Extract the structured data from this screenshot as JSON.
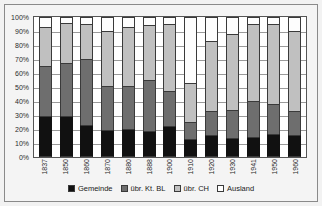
{
  "chart_data": {
    "type": "bar",
    "subtype": "stacked-100-percent",
    "title": "",
    "xlabel": "",
    "ylabel": "",
    "ylim": [
      0,
      100
    ],
    "ytick_labels": [
      "100%",
      "90%",
      "80%",
      "70%",
      "60%",
      "50%",
      "40%",
      "30%",
      "20%",
      "10%",
      "0%"
    ],
    "ytick_values": [
      100,
      90,
      80,
      70,
      60,
      50,
      40,
      30,
      20,
      10,
      0
    ],
    "grid": true,
    "legend_position": "bottom-center",
    "categories": [
      "1837",
      "1850",
      "1860",
      "1870",
      "1880",
      "1888",
      "1900",
      "1910",
      "1920",
      "1930",
      "1941",
      "1950",
      "1960"
    ],
    "series": [
      {
        "name": "Gemeinde",
        "color": "#111111",
        "values": [
          29,
          29,
          23,
          19,
          20,
          18.5,
          22,
          13,
          16,
          13.5,
          14.5,
          16.5,
          15.5
        ]
      },
      {
        "name": "übr. Kt. BL",
        "color": "#6e6e6e",
        "values": [
          36,
          38,
          47,
          32,
          31,
          36.5,
          25,
          12,
          17,
          20,
          25.5,
          21.5,
          17.5
        ]
      },
      {
        "name": "übr. CH",
        "color": "#c0c0c0",
        "values": [
          28,
          29,
          25,
          39,
          42,
          39,
          48,
          28,
          50,
          54.5,
          55,
          57,
          57
        ]
      },
      {
        "name": "Ausland",
        "color": "#ffffff",
        "values": [
          7,
          4,
          5,
          10,
          7,
          6,
          5,
          47,
          17,
          12,
          5,
          5,
          10
        ]
      }
    ]
  },
  "legend": {
    "items": [
      {
        "label": "Gemeinde"
      },
      {
        "label": "übr. Kt. BL"
      },
      {
        "label": "übr. CH"
      },
      {
        "label": "Ausland"
      }
    ]
  }
}
